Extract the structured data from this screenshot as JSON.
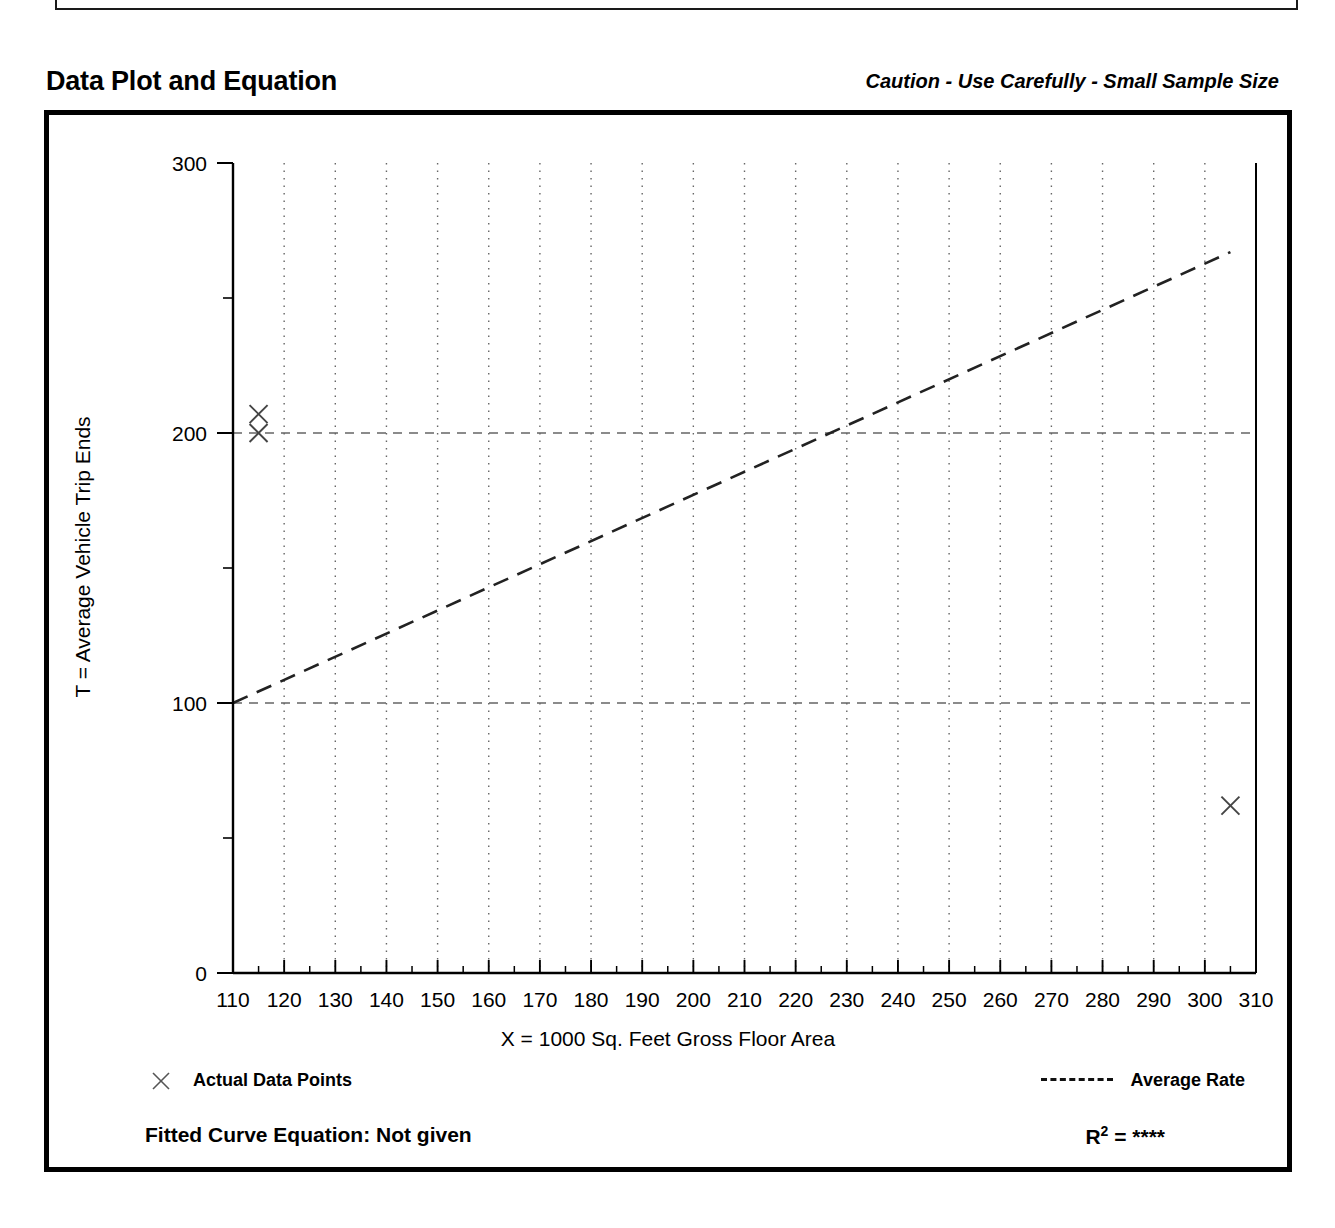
{
  "header": {
    "title": "Data Plot and Equation",
    "caution": "Caution - Use Carefully - Small Sample Size"
  },
  "legend": {
    "data_points_label": "Actual Data Points",
    "average_rate_label": "Average Rate",
    "marker_icon": "x-marker-icon",
    "line_icon": "dashed-line-icon"
  },
  "footer": {
    "equation_label": "Fitted Curve Equation:  Not given",
    "r2_prefix": "R",
    "r2_exponent": "2",
    "r2_equals": " = ",
    "r2_value": "****"
  },
  "chart_data": {
    "type": "scatter",
    "title": "",
    "xlabel": "X = 1000 Sq. Feet Gross Floor Area",
    "ylabel": "T = Average Vehicle Trip Ends",
    "xlim": [
      110,
      310
    ],
    "ylim": [
      0,
      300
    ],
    "xticks": [
      110,
      120,
      130,
      140,
      150,
      160,
      170,
      180,
      190,
      200,
      210,
      220,
      230,
      240,
      250,
      260,
      270,
      280,
      290,
      300,
      310
    ],
    "xtick_labels": [
      "110",
      "120",
      "130",
      "140",
      "150",
      "160",
      "170",
      "180",
      "190",
      "200",
      "210",
      "220",
      "230",
      "240",
      "250",
      "260",
      "270",
      "280",
      "290",
      "300",
      "310"
    ],
    "x_minor_step": 5,
    "yticks": [
      0,
      100,
      200,
      300
    ],
    "ytick_labels": [
      "0",
      "100",
      "200",
      "300"
    ],
    "y_minor_step": 50,
    "grid": "dotted-vertical-at-major-x-and-dashed-horizontal-at-100-200",
    "legend_position": "below-plot",
    "points": [
      {
        "x": 115,
        "y": 207
      },
      {
        "x": 115,
        "y": 200
      },
      {
        "x": 305,
        "y": 62
      }
    ],
    "series": [
      {
        "name": "Average Rate",
        "style": "dashed",
        "x": [
          110,
          305
        ],
        "values": [
          100,
          267
        ]
      }
    ]
  }
}
